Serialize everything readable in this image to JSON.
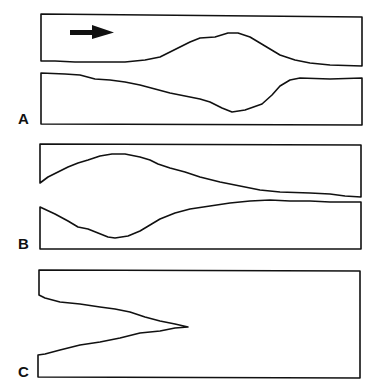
{
  "figure": {
    "panels": [
      {
        "id": "A",
        "label": "A",
        "description": "Symmetric dilation (bulge) of channel walls in the middle"
      },
      {
        "id": "B",
        "label": "B",
        "description": "Dilation near the inlet tapering toward the outlet"
      },
      {
        "id": "C",
        "label": "C",
        "description": "Wedge-shaped intrusion from the left wall"
      }
    ],
    "flow_direction_icon": "arrow-right-icon",
    "colors": {
      "stroke": "#111111",
      "background": "#ffffff"
    }
  }
}
